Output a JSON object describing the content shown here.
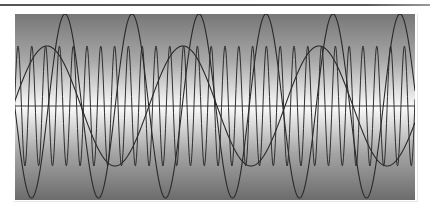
{
  "chart_data": {
    "type": "line",
    "title": "",
    "xlabel": "",
    "ylabel": "",
    "grid": false,
    "legend": null,
    "background": {
      "style": "vertical-gradient",
      "stops": [
        {
          "offset": 0.0,
          "color": "#777777"
        },
        {
          "offset": 0.25,
          "color": "#a8a8a8"
        },
        {
          "offset": 0.5,
          "color": "#fbfbfb"
        },
        {
          "offset": 0.75,
          "color": "#a4a4a4"
        },
        {
          "offset": 1.0,
          "color": "#6c6c6c"
        }
      ]
    },
    "plot_area_px": {
      "x0": 14,
      "y0": 14,
      "x1": 415,
      "y1": 200,
      "center_y": 106
    },
    "baseline": {
      "y_value": 0,
      "color": "#3a3a3a"
    },
    "series": [
      {
        "name": "high-frequency sine",
        "function": "sine",
        "amplitude_px": 60,
        "period_px": 13.8,
        "first_peak_x_px": 18,
        "color": "#2f2f2f",
        "approx_cycles_visible": 29
      },
      {
        "name": "medium-frequency sine",
        "function": "sine",
        "amplitude_px": 92,
        "period_px": 67,
        "first_peak_x_px": 65,
        "color": "#2a2a2a",
        "peaks_x_px": [
          65,
          131,
          200,
          266,
          333,
          400
        ],
        "troughs_x_px": [
          33,
          100,
          166,
          233,
          300,
          366
        ]
      },
      {
        "name": "low-frequency sine",
        "function": "sine",
        "amplitude_px": 60,
        "period_px": 136,
        "first_peak_x_px": 47,
        "color": "#2a2a2a",
        "peaks_x_px": [
          47,
          183,
          318
        ]
      }
    ]
  }
}
